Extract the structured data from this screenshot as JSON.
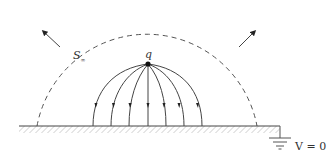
{
  "diagram": {
    "charge_label": "q",
    "surface_label": "S",
    "surface_subscript": "∞",
    "ground_label": "V = 0",
    "field_line_count": 7,
    "colors": {
      "line": "#444444",
      "dashed": "#555555",
      "hatch": "#888888",
      "charge": "#111111"
    }
  }
}
